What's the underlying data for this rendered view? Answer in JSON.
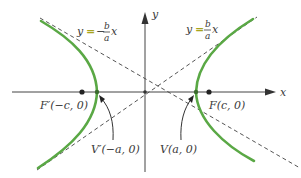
{
  "diagram": {
    "axes": {
      "x_label": "x",
      "y_label": "y"
    },
    "asymptotes": {
      "negative": {
        "lhs": "y",
        "eq": "=",
        "sign": "−",
        "num": "b",
        "den": "a",
        "var": "x"
      },
      "positive": {
        "lhs": "y",
        "eq": "=",
        "num": "b",
        "den": "a",
        "var": "x"
      }
    },
    "points": {
      "left_focus": {
        "label": "F′(−c, 0)"
      },
      "right_focus": {
        "label": "F(c, 0)"
      },
      "left_vertex": {
        "label": "V′(−a, 0)"
      },
      "right_vertex": {
        "label": "V(a, 0)"
      }
    },
    "colors": {
      "curve": "#5aa845",
      "axis": "#444444",
      "asymptote": "#555555",
      "equals_sign": "#a8a41e",
      "point": "#222222"
    }
  }
}
